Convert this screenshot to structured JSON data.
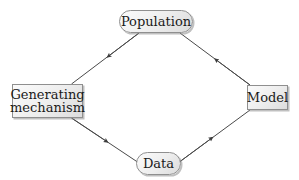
{
  "figure": {
    "title": "",
    "background_color": "#ffffff",
    "line_color": "#4a4a4a",
    "node_border_color": "#8f8f8f",
    "node_fill_color": "#ededed",
    "text_color": "#1a1a1a"
  },
  "nodes": {
    "population": {
      "label": "Population",
      "shape": "rounded-rectangle"
    },
    "generating_mechanism": {
      "label": "Generating\nmechanism",
      "shape": "rectangle"
    },
    "model": {
      "label": "Model",
      "shape": "rectangle"
    },
    "data": {
      "label": "Data",
      "shape": "rounded-rectangle"
    }
  },
  "edges": [
    {
      "from": "population",
      "to": "generating_mechanism",
      "label": "",
      "arrow": "single"
    },
    {
      "from": "generating_mechanism",
      "to": "data",
      "label": "",
      "arrow": "single"
    },
    {
      "from": "data",
      "to": "model",
      "label": "",
      "arrow": "single"
    },
    {
      "from": "model",
      "to": "population",
      "label": "",
      "arrow": "single"
    }
  ]
}
